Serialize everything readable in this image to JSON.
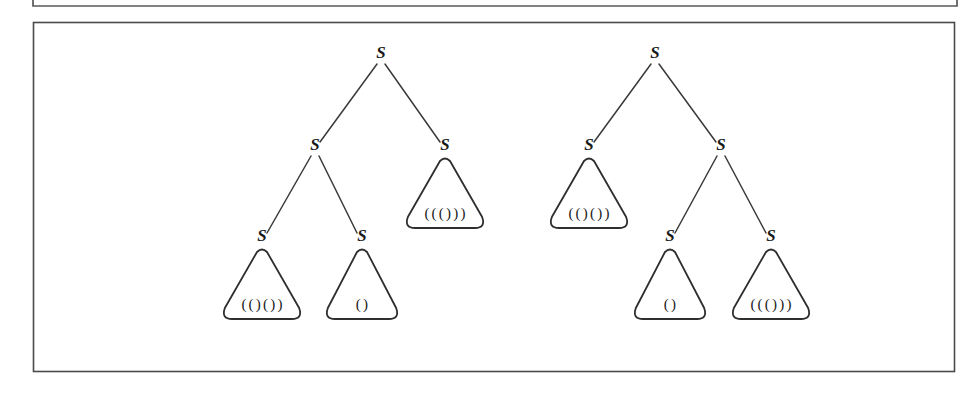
{
  "figure": {
    "caption": "",
    "background_color": "#ffffff",
    "line_color": "#2e2e2e",
    "frames": [
      {
        "name": "upper-frame-partial",
        "x": 33,
        "y": -40,
        "width": 924,
        "height": 46
      },
      {
        "name": "main-frame",
        "x": 33,
        "y": 22,
        "width": 922,
        "height": 350
      }
    ]
  },
  "trees": [
    {
      "id": "tree-left",
      "name": "parse-tree-left",
      "root": {
        "label": "S",
        "x": 381,
        "y": 58,
        "children": [
          {
            "label": "S",
            "x": 315,
            "y": 150,
            "children": [
              {
                "label": "S",
                "x": 262,
                "y": 241,
                "leaf": {
                  "text": "(()())",
                  "half_width": 41,
                  "height": 72
                }
              },
              {
                "label": "S",
                "x": 362,
                "y": 241,
                "leaf": {
                  "text": "()",
                  "half_width": 38,
                  "height": 72
                }
              }
            ]
          },
          {
            "label": "S",
            "x": 445,
            "y": 150,
            "leaf": {
              "text": "((()))",
              "half_width": 41,
              "height": 72
            }
          }
        ]
      }
    },
    {
      "id": "tree-right",
      "name": "parse-tree-right",
      "root": {
        "label": "S",
        "x": 655,
        "y": 58,
        "children": [
          {
            "label": "S",
            "x": 589,
            "y": 150,
            "leaf": {
              "text": "(()())",
              "half_width": 41,
              "height": 72
            }
          },
          {
            "label": "S",
            "x": 721,
            "y": 150,
            "children": [
              {
                "label": "S",
                "x": 670,
                "y": 241,
                "leaf": {
                  "text": "()",
                  "half_width": 38,
                  "height": 72
                }
              },
              {
                "label": "S",
                "x": 771,
                "y": 241,
                "leaf": {
                  "text": "((()))",
                  "half_width": 41,
                  "height": 72
                }
              }
            ]
          }
        ]
      }
    }
  ],
  "labels": {
    "nonterminal": "S",
    "leaf_strings": [
      "(()())",
      "()",
      "((()))",
      "(()())",
      "()",
      "((()))"
    ]
  }
}
